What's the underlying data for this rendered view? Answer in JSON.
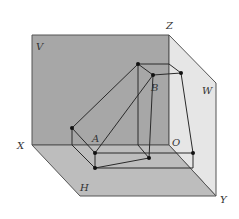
{
  "diagram": {
    "colors": {
      "v_plane": "#a7a7a7",
      "h_plane": "#bdbdbd",
      "w_plane": "#e6e6e6",
      "line": "#2a2a2a",
      "edge": "#555555"
    },
    "labels": {
      "V": "V",
      "W": "W",
      "H": "H",
      "X": "X",
      "Y": "Y",
      "Z": "Z",
      "O": "O",
      "A": "A",
      "B": "B"
    },
    "points": {
      "a_prime": [
        72,
        128
      ],
      "b_prime": [
        138,
        64
      ],
      "A": [
        95,
        153
      ],
      "B": [
        153,
        75
      ],
      "a": [
        95,
        168
      ],
      "b": [
        149,
        158
      ],
      "a_double": [
        193,
        153
      ],
      "b_double": [
        181,
        73
      ]
    }
  }
}
